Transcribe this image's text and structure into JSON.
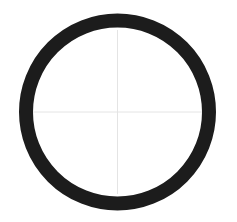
{
  "diagram": {
    "shape": "ring",
    "center": {
      "x": 117.5,
      "y": 112
    },
    "outer_radius": 98.5,
    "ring_thickness": 14,
    "ring_color": "#1c1c1c",
    "crosshair_color": "#e4e4e4",
    "background": "#ffffff"
  }
}
